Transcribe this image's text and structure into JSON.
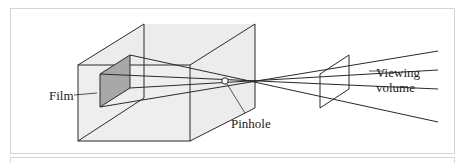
{
  "figure": {
    "labels": {
      "film": "Film",
      "pinhole": "Pinhole",
      "viewing_volume_line1": "Viewing",
      "viewing_volume_line2": "volume"
    },
    "colors": {
      "box_fill": "#ececec",
      "film_fill": "#a8a8a8",
      "line": "#2a2a2a",
      "frame_border": "#d4d4d4"
    }
  }
}
